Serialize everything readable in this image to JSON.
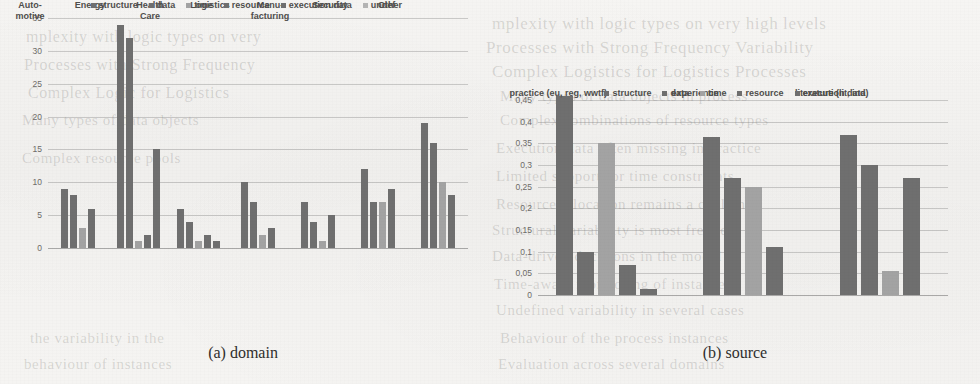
{
  "page": {
    "background_color": "#f3f2f0",
    "bleed_through_text": [
      "mplexity with logic types on very high levels",
      "Processes with Strong Frequency Variability",
      "Complex Logistics for Logistics Processes",
      "Many types of data objects in process",
      "Complex combinations of resource types",
      "Execution data often missing in practice",
      "Limited support for time constraints",
      "Resource allocation remains a challenge",
      "Structural variability is most frequent",
      "Data-driven decisions in the model",
      "Time-aware monitoring of instances",
      "Undefined variability in several cases",
      "Behaviour of the process instances",
      "Evaluation across several domains",
      "mplexity with logic types on very",
      "Processes with Strong Frequency",
      "Complex Logic for Logistics",
      "Many types of data objects",
      "Complex resource pools",
      "the variability in the",
      "behaviour of instances"
    ]
  },
  "figure_a": {
    "caption": "(a) domain",
    "colors": {
      "structure": "#6f6f6f",
      "data": "#6f6f6f",
      "time": "#a3a3a3",
      "resource": "#6f6f6f",
      "execution_data": "#6f6f6f",
      "undef": "#b4b4b4"
    },
    "legend": [
      {
        "label": "structure",
        "swatch": "dark"
      },
      {
        "label": "data",
        "swatch": "dark"
      },
      {
        "label": "time",
        "swatch": "light"
      },
      {
        "label": "resource",
        "swatch": "dark"
      },
      {
        "label": "execution data",
        "swatch": "dark"
      },
      {
        "label": "undef",
        "swatch": "lighter"
      }
    ]
  },
  "figure_b": {
    "caption": "(b) source",
    "legend": [
      {
        "label": "structure",
        "swatch": "dark"
      },
      {
        "label": "data",
        "swatch": "dark"
      },
      {
        "label": "time",
        "swatch": "light"
      },
      {
        "label": "resource",
        "swatch": "dark"
      },
      {
        "label": "execution data",
        "swatch": "dark"
      }
    ]
  },
  "chart_data": [
    {
      "id": "chart-a",
      "type": "bar",
      "title": "(a) domain",
      "xlabel": "",
      "ylabel": "",
      "ylim": [
        0,
        35
      ],
      "yticks": [
        0,
        5,
        10,
        15,
        20,
        25,
        30,
        35
      ],
      "ytick_labels": [
        "0",
        "5",
        "10",
        "15",
        "20",
        "25",
        "30",
        "35"
      ],
      "grid": true,
      "legend_position": "bottom",
      "categories": [
        [
          "Auto-",
          "motive"
        ],
        [
          "Energy"
        ],
        [
          "Health",
          "Care"
        ],
        [
          "Logistics"
        ],
        [
          "Manu-",
          "facturing"
        ],
        [
          "Security"
        ],
        [
          "Other"
        ]
      ],
      "series": [
        {
          "name": "structure",
          "values": [
            9,
            34,
            6,
            10,
            7,
            12,
            19
          ]
        },
        {
          "name": "data",
          "values": [
            8,
            32,
            4,
            7,
            4,
            7,
            16
          ]
        },
        {
          "name": "time",
          "values": [
            3,
            1,
            1,
            2,
            1,
            7,
            10
          ]
        },
        {
          "name": "resource",
          "values": [
            6,
            2,
            2,
            3,
            5,
            9,
            8
          ]
        },
        {
          "name": "execution data",
          "values": [
            0,
            15,
            1,
            0,
            0,
            0,
            0
          ]
        },
        {
          "name": "undef",
          "values": [
            0,
            0,
            0,
            0,
            0,
            0,
            0
          ]
        }
      ]
    },
    {
      "id": "chart-b",
      "type": "bar",
      "title": "(b) source",
      "xlabel": "",
      "ylabel": "",
      "ylim": [
        0,
        0.45
      ],
      "yticks": [
        0,
        0.05,
        0.1,
        0.15,
        0.2,
        0.25,
        0.3,
        0.35,
        0.4,
        0.45
      ],
      "ytick_labels": [
        "0",
        "0,05",
        "0,1",
        "0,15",
        "0,2",
        "0,25",
        "0,3",
        "0,35",
        "0,4",
        "0,45"
      ],
      "grid": true,
      "legend_position": "bottom",
      "categories": [
        [
          "practice (eu, reg, wwtf)"
        ],
        [
          "experience"
        ],
        [
          "literature (lit, ind)"
        ]
      ],
      "series": [
        {
          "name": "structure",
          "values": [
            0.46,
            0.365,
            0.37
          ]
        },
        {
          "name": "data",
          "values": [
            0.1,
            0.27,
            0.3
          ]
        },
        {
          "name": "time",
          "values": [
            0.35,
            0.25,
            0.055
          ]
        },
        {
          "name": "resource",
          "values": [
            0.07,
            0.11,
            0.27
          ]
        },
        {
          "name": "execution data",
          "values": [
            0.015,
            0,
            0
          ]
        }
      ]
    }
  ]
}
